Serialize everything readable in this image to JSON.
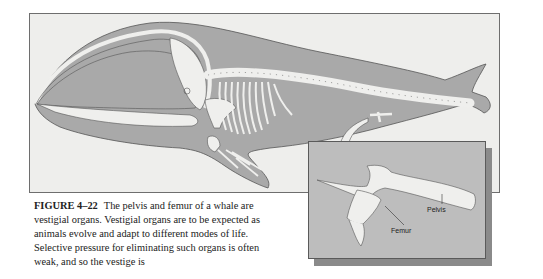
{
  "figure": {
    "number_label": "FIGURE 4–22",
    "caption": "The pelvis and femur of a whale are vestigial organs. Vestigial organs are to be expected as animals evolve and adapt to different modes of life. Selective pressure for eliminating such organs is often weak, and so the vestige is"
  },
  "inset": {
    "labels": {
      "pelvis": "Pelvis",
      "femur": "Femur"
    }
  },
  "colors": {
    "body_gray": "#a9a9a9",
    "bone": "#efefed",
    "background": "#eeeeec",
    "inset_bg": "#bdbdbd",
    "shadow": "#8a8a8a",
    "outline": "#555555"
  }
}
